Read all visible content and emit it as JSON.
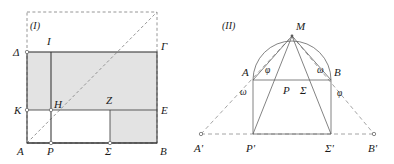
{
  "figure": {
    "background_color": "#ffffff",
    "ink_color": "#3b3b3b",
    "shade_color": "#e3e3e3",
    "dash_color": "#8a8a8a",
    "panels": [
      {
        "id": "panel-1",
        "caption": "(I)",
        "caption_x": 30,
        "caption_y": 29,
        "description": "Rectangle ADGB with interior subdivisions; gnomon shading; dashed square and diagonal",
        "points": [
          {
            "name": "A",
            "label": "A",
            "x": 27,
            "y": 143,
            "label_x": 17,
            "label_y": 155,
            "marker": "none"
          },
          {
            "name": "B",
            "label": "B",
            "x": 157,
            "y": 143,
            "label_x": 160,
            "label_y": 155,
            "marker": "none"
          },
          {
            "name": "Gamma",
            "label": "Γ",
            "x": 157,
            "y": 52,
            "label_x": 161,
            "label_y": 50,
            "marker": "none"
          },
          {
            "name": "Delta",
            "label": "Δ",
            "x": 27,
            "y": 52,
            "label_x": 13,
            "label_y": 56,
            "marker": "circle"
          },
          {
            "name": "K",
            "label": "K",
            "x": 27,
            "y": 110,
            "label_x": 14,
            "label_y": 114,
            "marker": "circle"
          },
          {
            "name": "E",
            "label": "E",
            "x": 157,
            "y": 110,
            "label_x": 161,
            "label_y": 114,
            "marker": "none"
          },
          {
            "name": "I",
            "label": "I",
            "x": 51,
            "y": 52,
            "label_x": 47,
            "label_y": 45,
            "marker": "none"
          },
          {
            "name": "P",
            "label": "P",
            "x": 51,
            "y": 143,
            "label_x": 47,
            "label_y": 155,
            "marker": "circle"
          },
          {
            "name": "H",
            "label": "H",
            "x": 51,
            "y": 110,
            "label_x": 54,
            "label_y": 108,
            "marker": "circle"
          },
          {
            "name": "Z",
            "label": "Z",
            "x": 110,
            "y": 110,
            "label_x": 106,
            "label_y": 104,
            "marker": "none"
          },
          {
            "name": "Sigma",
            "label": "Σ",
            "x": 110,
            "y": 143,
            "label_x": 105,
            "label_y": 155,
            "marker": "circle"
          }
        ],
        "dashed_square": {
          "x": 27,
          "y": 12,
          "width": 130,
          "height": 131
        },
        "diagonal": {
          "x1": 27,
          "y1": 143,
          "x2": 157,
          "y2": 12
        }
      },
      {
        "id": "panel-2",
        "caption": "(II)",
        "caption_x": 222,
        "caption_y": 29,
        "description": "Semicircle on diameter AB with apex M; inscribed rectangle APSB; extended rays to A', B' on baseline P'S'",
        "points": [
          {
            "name": "M",
            "label": "M",
            "x": 292,
            "y": 36,
            "label_x": 296,
            "label_y": 30,
            "marker": "dot"
          },
          {
            "name": "A",
            "label": "A",
            "x": 253,
            "y": 80,
            "label_x": 242,
            "label_y": 76,
            "marker": "none"
          },
          {
            "name": "B",
            "label": "B",
            "x": 331,
            "y": 80,
            "label_x": 334,
            "label_y": 76,
            "marker": "none"
          },
          {
            "name": "P",
            "label": "P",
            "x": 281,
            "y": 80,
            "label_x": 283,
            "label_y": 94,
            "marker": "none"
          },
          {
            "name": "Sigma",
            "label": "Σ",
            "x": 303,
            "y": 80,
            "label_x": 300,
            "label_y": 94,
            "marker": "none"
          },
          {
            "name": "Aprime",
            "label": "A'",
            "x": 201,
            "y": 134,
            "label_x": 194,
            "label_y": 152,
            "marker": "circle"
          },
          {
            "name": "Bprime",
            "label": "B'",
            "x": 374,
            "y": 134,
            "label_x": 368,
            "label_y": 152,
            "marker": "circle"
          },
          {
            "name": "Pprime",
            "label": "P'",
            "x": 253,
            "y": 134,
            "label_x": 246,
            "label_y": 152,
            "marker": "none"
          },
          {
            "name": "Sigmaprime",
            "label": "Σ'",
            "x": 331,
            "y": 134,
            "label_x": 325,
            "label_y": 152,
            "marker": "none"
          }
        ],
        "angles": [
          {
            "name": "phi-at-A",
            "label": "φ",
            "x": 265,
            "y": 73
          },
          {
            "name": "omega-at-B",
            "label": "ω",
            "x": 317,
            "y": 73
          },
          {
            "name": "omega-at-Aprime",
            "label": "ω",
            "x": 240,
            "y": 95
          },
          {
            "name": "phi-at-Bprime",
            "label": "φ",
            "x": 337,
            "y": 96
          }
        ],
        "semicircle": {
          "cx": 292,
          "cy": 80,
          "r": 39
        }
      }
    ]
  }
}
